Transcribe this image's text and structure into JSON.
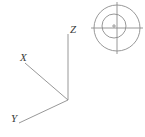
{
  "figure": {
    "title": "",
    "background_color": "#ffffff",
    "line_color": "#8c8c8c",
    "label_color": "#3a3a3a",
    "width": 145,
    "height": 137
  },
  "axes": {
    "origin": {
      "x": 68,
      "y": 100
    },
    "items": [
      {
        "name": "x-axis",
        "label": "X",
        "label_position": {
          "x": 20,
          "y": 52
        },
        "line": {
          "x1": 25,
          "y1": 63,
          "x2": 68,
          "y2": 100
        }
      },
      {
        "name": "y-axis",
        "label": "Y",
        "label_position": {
          "x": 11,
          "y": 113
        },
        "line": {
          "x1": 68,
          "y1": 100,
          "x2": 19,
          "y2": 123
        }
      },
      {
        "name": "z-axis",
        "label": "Z",
        "label_position": {
          "x": 70,
          "y": 24
        },
        "line": {
          "x1": 68,
          "y1": 34,
          "x2": 68,
          "y2": 100
        }
      }
    ]
  },
  "target": {
    "name": "crosshair-target",
    "center": {
      "x": 117,
      "y": 28
    },
    "outer_circle_radius": 23,
    "inner_circle": {
      "cx": 114,
      "cy": 26,
      "r": 12
    },
    "crosshair": {
      "horizontal": {
        "x1": 91,
        "y1": 28,
        "x2": 143,
        "y2": 28
      },
      "vertical": {
        "x1": 117,
        "y1": 2,
        "x2": 117,
        "y2": 54
      }
    },
    "center_mark": {
      "x": 114,
      "y": 26,
      "size": 3
    }
  }
}
